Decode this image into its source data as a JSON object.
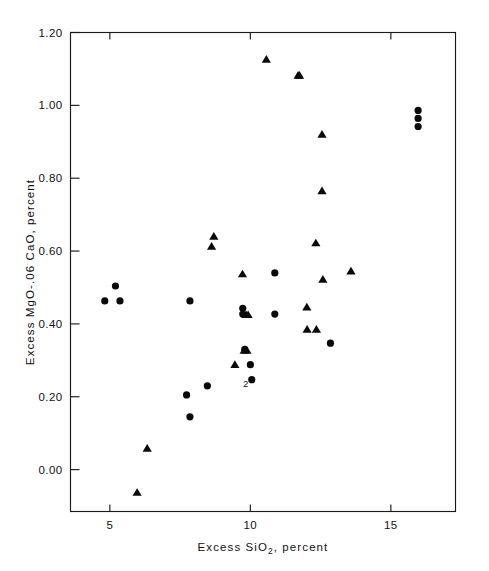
{
  "chart_data": {
    "type": "scatter",
    "title": "",
    "xlabel": "Excess SiO2, percent",
    "xlabel_parts": {
      "pre": "Excess SiO",
      "sub": "2",
      "post": ", percent"
    },
    "ylabel": "Excess MgO-.06 CaO, percent",
    "xlim": [
      3.6,
      17.3
    ],
    "ylim": [
      -0.115,
      1.2
    ],
    "xticks": [
      5,
      10,
      15
    ],
    "xtick_labels": [
      "5",
      "10",
      "15"
    ],
    "yticks": [
      0.0,
      0.2,
      0.4,
      0.6,
      0.8,
      1.0,
      1.2
    ],
    "ytick_labels": [
      "0.00",
      "0.20",
      "0.40",
      "0.60",
      "0.80",
      "1.00",
      "1.20"
    ],
    "grid": false,
    "legend": "none",
    "frame": "box",
    "marker_color": "#0a0a0a",
    "series": [
      {
        "name": "circles",
        "marker": "circle",
        "points": [
          {
            "x": 5.2,
            "y": 0.504
          },
          {
            "x": 4.82,
            "y": 0.463
          },
          {
            "x": 5.36,
            "y": 0.463
          },
          {
            "x": 7.85,
            "y": 0.463
          },
          {
            "x": 7.73,
            "y": 0.205
          },
          {
            "x": 7.85,
            "y": 0.145
          },
          {
            "x": 8.47,
            "y": 0.23
          },
          {
            "x": 9.73,
            "y": 0.443
          },
          {
            "x": 9.73,
            "y": 0.427
          },
          {
            "x": 10.87,
            "y": 0.54
          },
          {
            "x": 10.87,
            "y": 0.427
          },
          {
            "x": 9.8,
            "y": 0.33
          },
          {
            "x": 10.0,
            "y": 0.288
          },
          {
            "x": 10.05,
            "y": 0.247
          },
          {
            "x": 12.85,
            "y": 0.347
          },
          {
            "x": 15.97,
            "y": 0.986
          },
          {
            "x": 15.97,
            "y": 0.964
          },
          {
            "x": 15.97,
            "y": 0.942
          }
        ]
      },
      {
        "name": "triangles",
        "marker": "triangle",
        "points": [
          {
            "x": 5.97,
            "y": -0.063
          },
          {
            "x": 6.33,
            "y": 0.058
          },
          {
            "x": 8.7,
            "y": 0.64
          },
          {
            "x": 8.62,
            "y": 0.613
          },
          {
            "x": 9.72,
            "y": 0.537
          },
          {
            "x": 9.85,
            "y": 0.425
          },
          {
            "x": 9.92,
            "y": 0.425
          },
          {
            "x": 9.78,
            "y": 0.327
          },
          {
            "x": 9.88,
            "y": 0.327
          },
          {
            "x": 9.45,
            "y": 0.288
          },
          {
            "x": 10.57,
            "y": 1.126
          },
          {
            "x": 11.7,
            "y": 1.082
          },
          {
            "x": 11.75,
            "y": 1.082
          },
          {
            "x": 12.55,
            "y": 0.92
          },
          {
            "x": 12.55,
            "y": 0.765
          },
          {
            "x": 12.33,
            "y": 0.622
          },
          {
            "x": 12.58,
            "y": 0.522
          },
          {
            "x": 13.58,
            "y": 0.545
          },
          {
            "x": 12.01,
            "y": 0.446
          },
          {
            "x": 12.02,
            "y": 0.385
          },
          {
            "x": 12.35,
            "y": 0.385
          }
        ]
      }
    ],
    "annotations": [
      {
        "text": "2",
        "x": 10.05,
        "y": 0.228
      }
    ]
  }
}
